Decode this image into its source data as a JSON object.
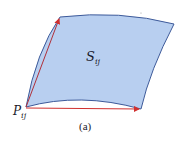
{
  "diagram": {
    "surface_label": {
      "main": "S",
      "sub": "ij"
    },
    "point_label": {
      "main": "P",
      "sub": "ij"
    },
    "caption": "(a)",
    "colors": {
      "surface_fill": "#b8cff0",
      "surface_edge": "#3d5a9a",
      "vector": "#d0302f"
    }
  }
}
